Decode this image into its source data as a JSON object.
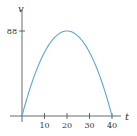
{
  "chart_data": {
    "type": "line",
    "title": "",
    "xlabel": "t",
    "ylabel": "v",
    "x_ticks": [
      10,
      20,
      30,
      40
    ],
    "y_ticks": [
      88
    ],
    "xlim": [
      0,
      40
    ],
    "ylim": [
      0,
      88
    ],
    "grid": false,
    "series": [
      {
        "name": "v(t)",
        "x": [
          0,
          5,
          10,
          15,
          20,
          25,
          30,
          35,
          40
        ],
        "values": [
          0,
          38.5,
          66,
          82.5,
          88,
          82.5,
          66,
          38.5,
          0
        ]
      }
    ],
    "colors": {
      "curve": "#5aa6d6",
      "axis": "#444444"
    }
  },
  "labels": {
    "x_axis": "t",
    "y_axis": "v",
    "y_tick_88": "88",
    "x_tick_10": "10",
    "x_tick_20": "20",
    "x_tick_30": "30",
    "x_tick_40": "40"
  }
}
